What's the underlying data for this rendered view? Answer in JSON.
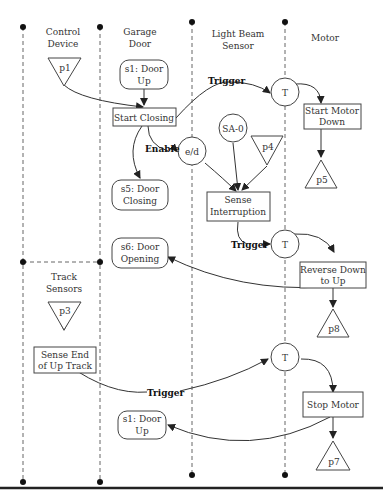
{
  "lanes": [
    {
      "id": "control-device",
      "label_lines": [
        "Control",
        "Device"
      ]
    },
    {
      "id": "garage-door",
      "label_lines": [
        "Garage",
        "Door"
      ]
    },
    {
      "id": "light-beam-sensor",
      "label_lines": [
        "Light Beam",
        "Sensor"
      ]
    },
    {
      "id": "motor",
      "label_lines": [
        "Motor"
      ]
    },
    {
      "id": "track-sensors",
      "label_lines": [
        "Track",
        "Sensors"
      ]
    }
  ],
  "places": {
    "p1": "p1",
    "p3": "p3",
    "p4": "p4",
    "p5": "p5",
    "p7": "p7",
    "p8": "p8"
  },
  "states": {
    "s1_top": [
      "s1: Door",
      "Up"
    ],
    "s5": [
      "s5: Door",
      "Closing"
    ],
    "s6": [
      "s6: Door",
      "Opening"
    ],
    "s1_bottom": [
      "s1: Door",
      "Up"
    ]
  },
  "activities": {
    "start_closing": [
      "Start Closing"
    ],
    "start_motor_down": [
      "Start Motor",
      "Down"
    ],
    "sense_interruption": [
      "Sense",
      "Interruption"
    ],
    "reverse_down_to_up": [
      "Reverse Down",
      "to Up"
    ],
    "sense_end_up_track": [
      "Sense End",
      "of Up Track"
    ],
    "stop_motor": [
      "Stop Motor"
    ]
  },
  "nodes": {
    "t1": "T",
    "t2": "T",
    "t3": "T",
    "ed": "e/d",
    "sa0": "SA-0"
  },
  "edge_labels": {
    "trigger1": "Trigger",
    "enable": "Enable",
    "trigger2": "Trigger",
    "trigger3": "Trigger"
  }
}
